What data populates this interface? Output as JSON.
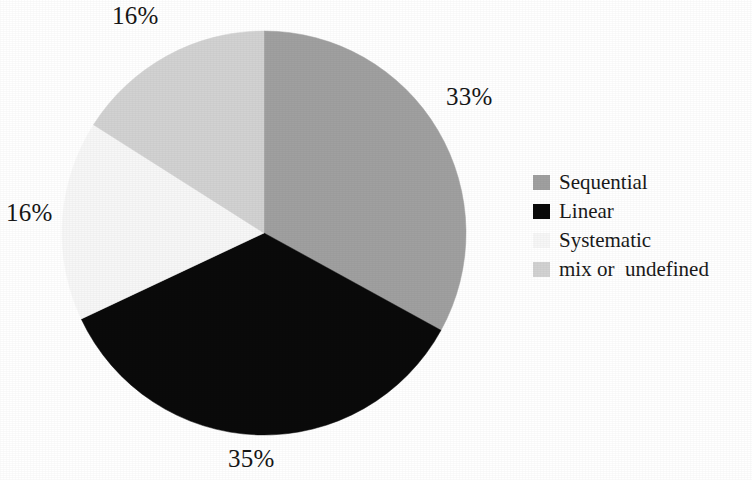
{
  "chart_data": {
    "type": "pie",
    "title": "",
    "subtitle": "",
    "xlabel": "",
    "ylabel": "",
    "grid": false,
    "legend_position": "right",
    "start_angle_deg": 0,
    "direction": "clockwise",
    "categories": [
      "Sequential",
      "Linear",
      "Systematic",
      "mix or  undefined"
    ],
    "values": [
      33,
      35,
      16,
      16
    ],
    "value_unit": "%",
    "data_labels": [
      "33%",
      "35%",
      "16%",
      "16%"
    ],
    "colors": [
      "#a0a0a0",
      "#0a0a0a",
      "#f7f7f7",
      "#d2d2d2"
    ],
    "slices": [
      {
        "label": "Sequential",
        "value": 33,
        "data_label": "33%",
        "color": "#a0a0a0",
        "start_angle_deg": 0,
        "end_angle_deg": 118.8,
        "label_position": "right"
      },
      {
        "label": "Linear",
        "value": 35,
        "data_label": "35%",
        "color": "#0a0a0a",
        "start_angle_deg": 118.8,
        "end_angle_deg": 244.8,
        "label_position": "bottom"
      },
      {
        "label": "Systematic",
        "value": 16,
        "data_label": "16%",
        "color": "#f7f7f7",
        "start_angle_deg": 244.8,
        "end_angle_deg": 302.4,
        "label_position": "left"
      },
      {
        "label": "mix or  undefined",
        "value": 16,
        "data_label": "16%",
        "color": "#d2d2d2",
        "start_angle_deg": 302.4,
        "end_angle_deg": 360,
        "label_position": "top-left"
      }
    ]
  },
  "pie_labels": {
    "sequential": "33%",
    "linear": "35%",
    "systematic": "16%",
    "mix": "16%"
  },
  "legend": {
    "items": [
      {
        "label": "Sequential",
        "color": "#a0a0a0"
      },
      {
        "label": "Linear",
        "color": "#0a0a0a"
      },
      {
        "label": "Systematic",
        "color": "#f7f7f7"
      },
      {
        "label": "mix or  undefined",
        "color": "#d2d2d2"
      }
    ]
  }
}
